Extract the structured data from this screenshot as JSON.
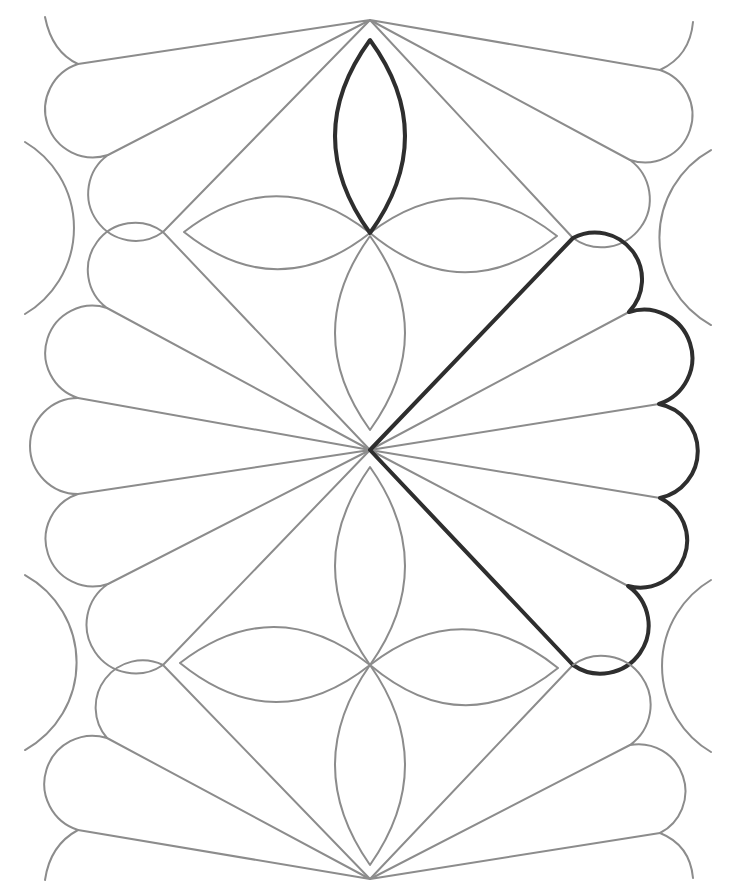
{
  "diagram": {
    "title": "Quilting motif: fans, diamonds and four-petal flowers",
    "colors": {
      "background": "#ffffff",
      "thin_stroke": "#8c8c8c",
      "bold_stroke": "#2e2e2e"
    },
    "points": {
      "top_apex": [
        370,
        20
      ],
      "center_hub": [
        370,
        450
      ],
      "bottom_apex": [
        370,
        879
      ],
      "diamond_upper_left": [
        163,
        232
      ],
      "diamond_upper_right": [
        573,
        238
      ],
      "diamond_lower_left": [
        163,
        665
      ],
      "diamond_lower_right": [
        573,
        665
      ],
      "upper_flower_center": [
        370,
        233
      ],
      "lower_flower_center": [
        370,
        665
      ]
    },
    "fans": {
      "center_right_highlighted": [
        [
          573,
          238
        ],
        [
          629,
          312
        ],
        [
          659,
          404
        ],
        [
          660,
          498
        ],
        [
          628,
          586
        ],
        [
          573,
          665
        ]
      ],
      "center_left": [
        [
          163,
          232
        ],
        [
          107,
          308
        ],
        [
          78,
          398
        ],
        [
          78,
          494
        ],
        [
          108,
          584
        ],
        [
          163,
          665
        ]
      ],
      "top_left": [
        [
          163,
          232
        ],
        [
          108,
          155
        ],
        [
          78,
          64
        ]
      ],
      "top_right": [
        [
          573,
          238
        ],
        [
          630,
          160
        ],
        [
          660,
          70
        ]
      ],
      "bottom_left": [
        [
          163,
          665
        ],
        [
          107,
          738
        ],
        [
          78,
          830
        ]
      ],
      "bottom_right": [
        [
          573,
          665
        ],
        [
          630,
          745
        ],
        [
          660,
          833
        ]
      ]
    },
    "highlighted_elements": [
      "upper-flower-top-petal",
      "center-right-fan"
    ]
  }
}
